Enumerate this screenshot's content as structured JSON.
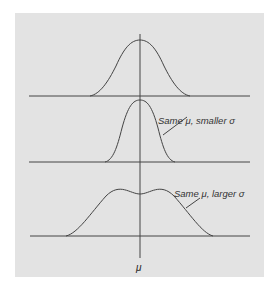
{
  "figure": {
    "annotations": {
      "smaller": "Same μ, smaller σ",
      "larger": "Same μ, larger σ"
    },
    "axis_label": "μ"
  },
  "curves": [
    {
      "name": "reference",
      "peak_y": 40,
      "half_width": 50
    },
    {
      "name": "smaller-sigma",
      "peak_y": 100,
      "half_width": 34
    },
    {
      "name": "larger-sigma",
      "peak_y": 164,
      "half_width": 74
    }
  ]
}
